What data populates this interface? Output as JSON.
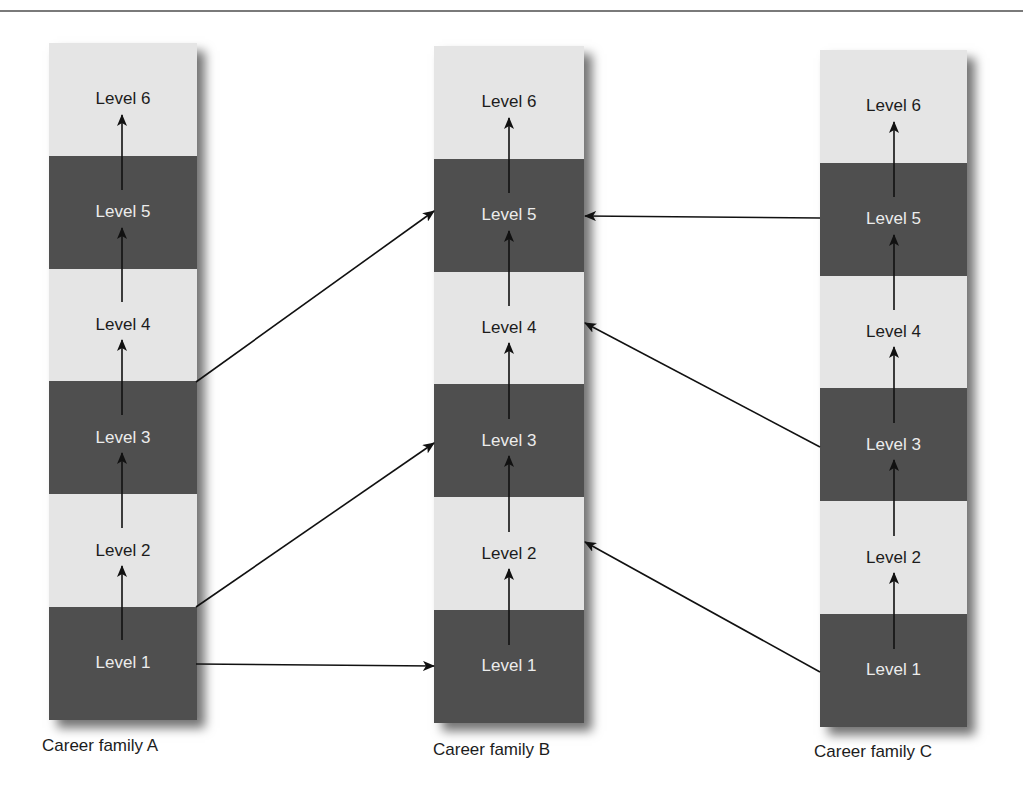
{
  "diagram": {
    "type": "career-path-diagram",
    "colors": {
      "band_dark": "#4f4f4f",
      "band_light": "#e5e5e5",
      "text_dark": "#1c1c1c",
      "text_light": "#ececec",
      "arrow": "#111111",
      "top_rule": "#7a7a7a"
    },
    "columns": [
      {
        "id": "A",
        "caption": "Career family A",
        "levels": [
          {
            "label": "Level 6",
            "shade": "light"
          },
          {
            "label": "Level 5",
            "shade": "dark"
          },
          {
            "label": "Level 4",
            "shade": "light"
          },
          {
            "label": "Level 3",
            "shade": "dark"
          },
          {
            "label": "Level 2",
            "shade": "light"
          },
          {
            "label": "Level 1",
            "shade": "dark"
          }
        ]
      },
      {
        "id": "B",
        "caption": "Career family B",
        "levels": [
          {
            "label": "Level 6",
            "shade": "light"
          },
          {
            "label": "Level 5",
            "shade": "dark"
          },
          {
            "label": "Level 4",
            "shade": "light"
          },
          {
            "label": "Level 3",
            "shade": "dark"
          },
          {
            "label": "Level 2",
            "shade": "light"
          },
          {
            "label": "Level 1",
            "shade": "dark"
          }
        ]
      },
      {
        "id": "C",
        "caption": "Career family C",
        "levels": [
          {
            "label": "Level 6",
            "shade": "light"
          },
          {
            "label": "Level 5",
            "shade": "dark"
          },
          {
            "label": "Level 4",
            "shade": "light"
          },
          {
            "label": "Level 3",
            "shade": "dark"
          },
          {
            "label": "Level 2",
            "shade": "light"
          },
          {
            "label": "Level 1",
            "shade": "dark"
          }
        ]
      }
    ],
    "internal_progression": "Each family progresses upward Level 1 → Level 2 → Level 3 → Level 4 → Level 5 → Level 6",
    "cross_family_moves": [
      {
        "from": "A Level 1",
        "to": "B Level 1"
      },
      {
        "from": "A Level 1/2 boundary",
        "to": "B Level 3"
      },
      {
        "from": "A Level 3/4 boundary",
        "to": "B Level 5"
      },
      {
        "from": "C Level 5",
        "to": "B Level 5"
      },
      {
        "from": "C Level 3",
        "to": "B Level 4"
      },
      {
        "from": "C Level 1",
        "to": "B Level 2"
      }
    ]
  }
}
